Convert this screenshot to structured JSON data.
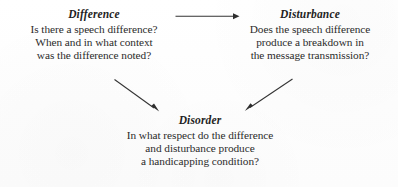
{
  "diagram": {
    "text_color": "#2b2b2b",
    "arrow_color": "#333333",
    "background_color": "#fefefe",
    "nodes": [
      {
        "id": "difference",
        "heading": "Difference",
        "lines": [
          "Is there a speech difference?",
          "When and in what context",
          "was the difference noted?"
        ]
      },
      {
        "id": "disturbance",
        "heading": "Disturbance",
        "lines": [
          "Does the speech difference",
          "produce a breakdown in",
          "the message transmission?"
        ]
      },
      {
        "id": "disorder",
        "heading": "Disorder",
        "lines": [
          "In what respect do the difference",
          "and disturbance produce",
          "a handicapping condition?"
        ]
      }
    ],
    "arrows": [
      {
        "id": "difference-to-disturbance",
        "from": "difference",
        "to": "disturbance",
        "direction": "right"
      },
      {
        "id": "difference-to-disorder",
        "from": "difference",
        "to": "disorder",
        "direction": "down-right"
      },
      {
        "id": "disturbance-to-disorder",
        "from": "disturbance",
        "to": "disorder",
        "direction": "down-left"
      }
    ]
  }
}
